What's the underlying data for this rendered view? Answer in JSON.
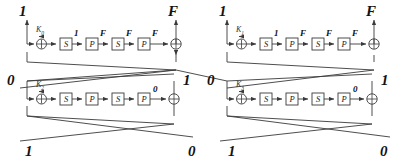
{
  "diagram": {
    "stroke_color": "#3a3a3a",
    "box_fill": "#ffffff",
    "text_color": "#111111",
    "sbox_label": "S",
    "pbox_label": "P",
    "rounds": [
      {
        "id": "round-top-left",
        "key_label": "K",
        "key_subscript": "0",
        "input_bit": "1",
        "output_bit": "F",
        "stage_labels": [
          "1",
          "F",
          "F",
          "F"
        ],
        "boxes": [
          "S",
          "P",
          "S",
          "P"
        ]
      },
      {
        "id": "round-top-right",
        "key_label": "K",
        "key_subscript": "1",
        "input_bit": "1",
        "output_bit": "F",
        "stage_labels": [
          "1",
          "F",
          "F",
          "F"
        ],
        "boxes": [
          "S",
          "P",
          "S",
          "P"
        ]
      },
      {
        "id": "round-bottom-left",
        "key_label": "K",
        "key_subscript": "2",
        "input_bit": "0",
        "output_bit": "1",
        "stage_labels": [
          "",
          "",
          "",
          "0"
        ],
        "boxes": [
          "S",
          "P",
          "S",
          "P"
        ]
      },
      {
        "id": "round-bottom-right",
        "key_label": "K",
        "key_subscript": "3",
        "input_bit": "0",
        "output_bit": "1",
        "stage_labels": [
          "",
          "",
          "",
          "0"
        ],
        "boxes": [
          "S",
          "P",
          "S",
          "P"
        ]
      }
    ],
    "bottom_bits": [
      "1",
      "0",
      "1",
      "0"
    ]
  }
}
